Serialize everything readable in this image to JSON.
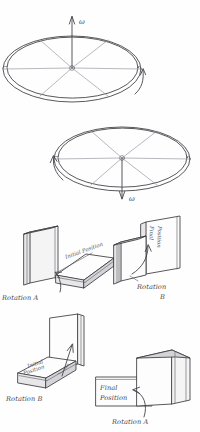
{
  "panels": {
    "disk_top": {
      "name": "Spinning disk, angular velocity up",
      "omega_symbol": "ω",
      "arrow_direction": "up",
      "spin_arrow": "counterclockwise",
      "spokes": 6
    },
    "disk_bottom": {
      "name": "Spinning disk, angular velocity down",
      "omega_symbol": "ω",
      "arrow_direction": "down",
      "spin_arrow": "clockwise",
      "spokes": 6
    },
    "book_a1": {
      "caption": "Rotation A",
      "book_label": "Initial Position"
    },
    "book_b1": {
      "caption_line1": "Rotation",
      "caption_line2": "B",
      "book_label_line1": "Final",
      "book_label_line2": "Position"
    },
    "book_b2": {
      "caption": "Rotation B",
      "book_label_line1": "Initial",
      "book_label_line2": "Position"
    },
    "book_a2": {
      "caption": "Rotation A",
      "book_label_line1": "Final",
      "book_label_line2": "Position"
    }
  },
  "colors": {
    "ink": "#3b3b40",
    "ink_light": "#9a9aa2",
    "paper": "#fefefe",
    "face_grey": "#e7e7e9"
  }
}
